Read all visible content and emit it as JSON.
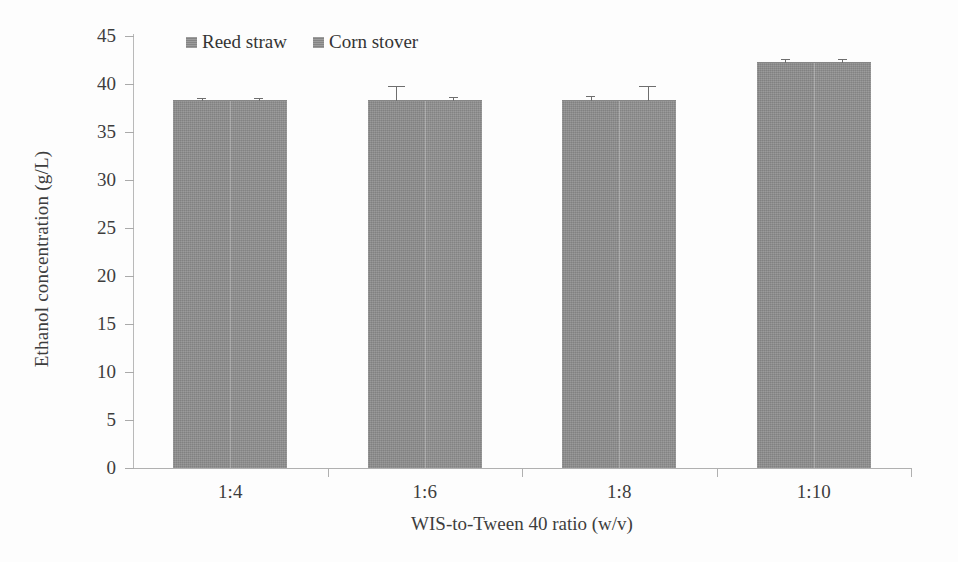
{
  "chart_data": {
    "type": "bar",
    "title": "",
    "xlabel": "WIS-to-Tween 40 ratio (w/v)",
    "ylabel": "Ethanol concentration (g/L)",
    "categories": [
      "1:4",
      "1:6",
      "1:8",
      "1:10"
    ],
    "ylim": [
      0,
      45
    ],
    "ytick_labels": [
      "45",
      "40",
      "35",
      "30",
      "25",
      "20",
      "15",
      "10",
      "5",
      "0"
    ],
    "ytick_values": [
      45,
      40,
      35,
      30,
      25,
      20,
      15,
      10,
      5,
      0
    ],
    "ytick_step": 5,
    "grid": false,
    "legend_position": "top-left-inside",
    "series": [
      {
        "name": "Reed straw",
        "color": "#8e8e8e",
        "values": [
          38.2,
          38.2,
          38.2,
          42.2
        ],
        "errors": [
          0.25,
          1.5,
          0.4,
          0.3
        ]
      },
      {
        "name": "Corn stover",
        "color": "#909090",
        "values": [
          38.2,
          38.2,
          38.2,
          42.2
        ],
        "errors": [
          0.25,
          0.35,
          1.5,
          0.3
        ]
      }
    ]
  },
  "legend": {
    "items": [
      {
        "label": "Reed straw",
        "swatch": "legend-swatch-icon"
      },
      {
        "label": "Corn stover",
        "swatch": "legend-swatch-icon"
      }
    ]
  },
  "axes": {
    "y_title": "Ethanol concentration (g/L)",
    "x_title": "WIS-to-Tween 40 ratio (w/v)"
  }
}
